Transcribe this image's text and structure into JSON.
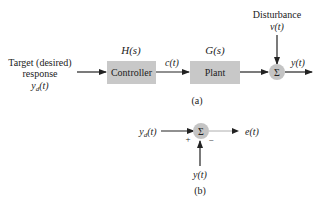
{
  "figure_a": {
    "input_label_line1": "Target (desired)",
    "input_label_line2": "response",
    "input_signal": "y",
    "input_signal_sub": "d",
    "input_signal_arg": "(t)",
    "controller": {
      "label": "Controller",
      "transfer": "H(s)"
    },
    "controller_output": "c(t)",
    "plant": {
      "label": "Plant",
      "transfer": "G(s)"
    },
    "disturbance_label": "Disturbance",
    "disturbance_signal": "v(t)",
    "sum_symbol": "Σ",
    "output_signal": "y(t)",
    "caption": "(a)"
  },
  "figure_b": {
    "input_signal": "y",
    "input_signal_sub": "d",
    "input_signal_arg": "(t)",
    "sum_symbol": "Σ",
    "plus_sign": "+",
    "minus_sign": "−",
    "output_signal": "e(t)",
    "feedback_signal": "y(t)",
    "caption": "(b)"
  },
  "colors": {
    "block_fill": "#c8c8c8",
    "sum_fill": "#c4c4c4",
    "line": "#222222"
  }
}
